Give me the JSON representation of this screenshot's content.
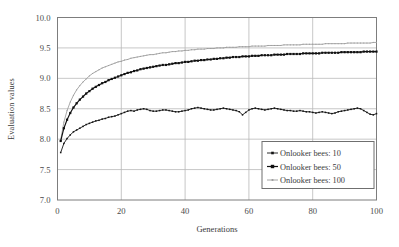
{
  "chart_data": {
    "type": "line",
    "title": "",
    "xlabel": "Generations",
    "ylabel": "Evaluation values",
    "xlim": [
      0,
      100
    ],
    "ylim": [
      7.0,
      10.0
    ],
    "xticks": [
      0,
      20,
      40,
      60,
      80,
      100
    ],
    "yticks": [
      7.0,
      7.5,
      8.0,
      8.5,
      9.0,
      9.5,
      10.0
    ],
    "xtick_labels": [
      "0",
      "20",
      "40",
      "60",
      "80",
      "100"
    ],
    "ytick_labels": [
      "7.0",
      "7.5",
      "8.0",
      "8.5",
      "9.0",
      "9.5",
      "10.0"
    ],
    "grid": true,
    "grid_color": "#b9b9b9",
    "legend_position": "lower-right-inside",
    "x": [
      1,
      2,
      3,
      4,
      5,
      6,
      7,
      8,
      9,
      10,
      11,
      12,
      13,
      14,
      15,
      16,
      17,
      18,
      19,
      20,
      21,
      22,
      23,
      24,
      25,
      26,
      27,
      28,
      29,
      30,
      31,
      32,
      33,
      34,
      35,
      36,
      37,
      38,
      39,
      40,
      41,
      42,
      43,
      44,
      45,
      46,
      47,
      48,
      49,
      50,
      51,
      52,
      53,
      54,
      55,
      56,
      57,
      58,
      59,
      60,
      61,
      62,
      63,
      64,
      65,
      66,
      67,
      68,
      69,
      70,
      71,
      72,
      73,
      74,
      75,
      76,
      77,
      78,
      79,
      80,
      81,
      82,
      83,
      84,
      85,
      86,
      87,
      88,
      89,
      90,
      91,
      92,
      93,
      94,
      95,
      96,
      97,
      98,
      99,
      100
    ],
    "series": [
      {
        "name": "Onlooker bees: 10",
        "color": "#141414",
        "marker": "square-small",
        "values": [
          7.78,
          7.93,
          8.01,
          8.07,
          8.12,
          8.15,
          8.18,
          8.21,
          8.24,
          8.26,
          8.28,
          8.3,
          8.31,
          8.33,
          8.34,
          8.36,
          8.37,
          8.38,
          8.4,
          8.42,
          8.44,
          8.46,
          8.47,
          8.46,
          8.48,
          8.49,
          8.5,
          8.49,
          8.47,
          8.46,
          8.46,
          8.47,
          8.48,
          8.48,
          8.47,
          8.46,
          8.45,
          8.45,
          8.46,
          8.47,
          8.48,
          8.5,
          8.51,
          8.52,
          8.51,
          8.5,
          8.49,
          8.48,
          8.48,
          8.49,
          8.5,
          8.51,
          8.5,
          8.49,
          8.48,
          8.47,
          8.45,
          8.4,
          8.44,
          8.48,
          8.5,
          8.51,
          8.5,
          8.49,
          8.48,
          8.49,
          8.5,
          8.51,
          8.5,
          8.49,
          8.48,
          8.47,
          8.47,
          8.46,
          8.46,
          8.47,
          8.46,
          8.45,
          8.45,
          8.44,
          8.43,
          8.44,
          8.45,
          8.44,
          8.43,
          8.42,
          8.43,
          8.45,
          8.46,
          8.47,
          8.48,
          8.49,
          8.5,
          8.51,
          8.5,
          8.47,
          8.44,
          8.41,
          8.4,
          8.42
        ]
      },
      {
        "name": "Onlooker bees: 50",
        "color": "#111111",
        "marker": "square-large",
        "values": [
          7.97,
          8.18,
          8.32,
          8.43,
          8.52,
          8.59,
          8.65,
          8.7,
          8.75,
          8.79,
          8.83,
          8.86,
          8.89,
          8.92,
          8.94,
          8.97,
          8.99,
          9.01,
          9.03,
          9.05,
          9.07,
          9.09,
          9.1,
          9.12,
          9.13,
          9.15,
          9.16,
          9.17,
          9.18,
          9.19,
          9.2,
          9.21,
          9.22,
          9.22,
          9.23,
          9.24,
          9.25,
          9.25,
          9.26,
          9.27,
          9.27,
          9.28,
          9.29,
          9.29,
          9.3,
          9.3,
          9.31,
          9.31,
          9.32,
          9.32,
          9.33,
          9.33,
          9.34,
          9.34,
          9.35,
          9.35,
          9.35,
          9.36,
          9.36,
          9.36,
          9.37,
          9.37,
          9.37,
          9.38,
          9.38,
          9.38,
          9.38,
          9.39,
          9.39,
          9.39,
          9.39,
          9.4,
          9.4,
          9.4,
          9.4,
          9.4,
          9.41,
          9.41,
          9.41,
          9.41,
          9.41,
          9.41,
          9.42,
          9.42,
          9.42,
          9.42,
          9.42,
          9.42,
          9.43,
          9.43,
          9.43,
          9.43,
          9.43,
          9.43,
          9.43,
          9.44,
          9.44,
          9.44,
          9.44,
          9.44
        ]
      },
      {
        "name": "Onlooker bees: 100",
        "color": "#9a9a9a",
        "marker": "dot-small",
        "values": [
          7.99,
          8.28,
          8.47,
          8.61,
          8.72,
          8.81,
          8.88,
          8.94,
          8.99,
          9.04,
          9.08,
          9.11,
          9.14,
          9.17,
          9.19,
          9.21,
          9.23,
          9.25,
          9.27,
          9.28,
          9.3,
          9.31,
          9.33,
          9.34,
          9.35,
          9.36,
          9.37,
          9.38,
          9.39,
          9.39,
          9.4,
          9.41,
          9.42,
          9.42,
          9.43,
          9.44,
          9.44,
          9.45,
          9.45,
          9.46,
          9.46,
          9.47,
          9.47,
          9.48,
          9.48,
          9.48,
          9.49,
          9.49,
          9.49,
          9.5,
          9.5,
          9.5,
          9.51,
          9.51,
          9.51,
          9.51,
          9.52,
          9.52,
          9.52,
          9.52,
          9.53,
          9.53,
          9.53,
          9.53,
          9.53,
          9.54,
          9.54,
          9.54,
          9.54,
          9.54,
          9.55,
          9.55,
          9.55,
          9.55,
          9.55,
          9.55,
          9.56,
          9.56,
          9.56,
          9.56,
          9.56,
          9.56,
          9.56,
          9.57,
          9.57,
          9.57,
          9.57,
          9.57,
          9.57,
          9.57,
          9.58,
          9.58,
          9.58,
          9.58,
          9.58,
          9.58,
          9.58,
          9.58,
          9.59,
          9.59
        ]
      }
    ]
  },
  "legend": {
    "items": [
      {
        "label": "Onlooker bees: 10"
      },
      {
        "label": "Onlooker bees: 50"
      },
      {
        "label": "Onlooker bees: 100"
      }
    ]
  }
}
